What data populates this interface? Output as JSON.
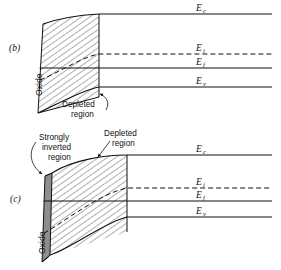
{
  "figure": {
    "background_color": "#ffffff",
    "ink_color": "#111111",
    "inverted_region_fill": "#8e8e8e"
  },
  "panels": [
    {
      "id": "b",
      "label": "(b)",
      "oxide_label": "Oxide",
      "annotations": [
        {
          "name": "depleted-region",
          "line1": "Depleted",
          "line2": "region"
        }
      ],
      "band_labels": [
        {
          "name": "conduction-band",
          "symbol": "E",
          "subscript": "c"
        },
        {
          "name": "intrinsic-level",
          "symbol": "E",
          "subscript": "i"
        },
        {
          "name": "fermi-level",
          "symbol": "E",
          "subscript": "f"
        },
        {
          "name": "valence-band",
          "symbol": "E",
          "subscript": "v"
        }
      ]
    },
    {
      "id": "c",
      "label": "(c)",
      "oxide_label": "Oxide",
      "annotations": [
        {
          "name": "strongly-inverted-region",
          "line1": "Strongly",
          "line2": "inverted",
          "line3": "region"
        },
        {
          "name": "depleted-region",
          "line1": "Depleted",
          "line2": "region"
        }
      ],
      "band_labels": [
        {
          "name": "conduction-band",
          "symbol": "E",
          "subscript": "c"
        },
        {
          "name": "intrinsic-level",
          "symbol": "E",
          "subscript": "i"
        },
        {
          "name": "fermi-level",
          "symbol": "E",
          "subscript": "f"
        },
        {
          "name": "valence-band",
          "symbol": "E",
          "subscript": "v"
        }
      ]
    }
  ]
}
